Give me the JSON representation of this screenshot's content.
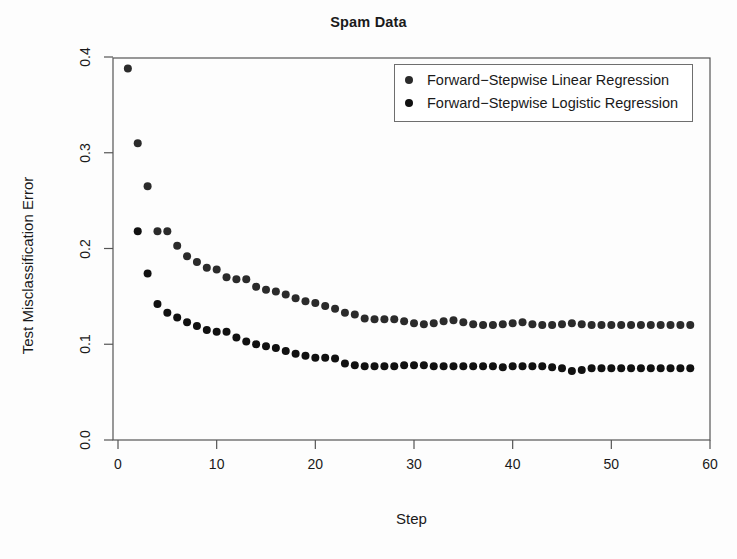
{
  "chart_data": {
    "type": "scatter",
    "title": "Spam Data",
    "xlabel": "Step",
    "ylabel": "Test Misclassification Error",
    "xlim": [
      0,
      60
    ],
    "ylim": [
      0.0,
      0.4
    ],
    "xticks": [
      0,
      10,
      20,
      30,
      40,
      50,
      60
    ],
    "xtick_labels": [
      "0",
      "10",
      "20",
      "30",
      "40",
      "50",
      "60"
    ],
    "yticks": [
      0.0,
      0.1,
      0.2,
      0.3,
      0.4
    ],
    "ytick_labels": [
      "0.0",
      "0.1",
      "0.2",
      "0.3",
      "0.4"
    ],
    "grid": false,
    "legend_position": "top-right",
    "marker": "filled-circle",
    "marker_size_px": 8,
    "series": [
      {
        "name": "Forward−Stepwise Linear Regression",
        "color": "#2b2b2b",
        "x": [
          1,
          2,
          3,
          4,
          5,
          6,
          7,
          8,
          9,
          10,
          11,
          12,
          13,
          14,
          15,
          16,
          17,
          18,
          19,
          20,
          21,
          22,
          23,
          24,
          25,
          26,
          27,
          28,
          29,
          30,
          31,
          32,
          33,
          34,
          35,
          36,
          37,
          38,
          39,
          40,
          41,
          42,
          43,
          44,
          45,
          46,
          47,
          48,
          49,
          50,
          51,
          52,
          53,
          54,
          55,
          56,
          57,
          58
        ],
        "y": [
          0.388,
          0.31,
          0.265,
          0.218,
          0.218,
          0.203,
          0.192,
          0.186,
          0.18,
          0.178,
          0.17,
          0.168,
          0.168,
          0.16,
          0.157,
          0.155,
          0.152,
          0.148,
          0.145,
          0.143,
          0.14,
          0.137,
          0.133,
          0.131,
          0.127,
          0.126,
          0.126,
          0.126,
          0.124,
          0.122,
          0.121,
          0.122,
          0.124,
          0.125,
          0.123,
          0.121,
          0.12,
          0.12,
          0.121,
          0.122,
          0.123,
          0.121,
          0.12,
          0.12,
          0.121,
          0.122,
          0.121,
          0.12,
          0.12,
          0.12,
          0.12,
          0.12,
          0.12,
          0.12,
          0.12,
          0.12,
          0.12,
          0.12
        ]
      },
      {
        "name": "Forward−Stepwise Logistic Regression",
        "color": "#111111",
        "x": [
          2,
          3,
          4,
          5,
          6,
          7,
          8,
          9,
          10,
          11,
          12,
          13,
          14,
          15,
          16,
          17,
          18,
          19,
          20,
          21,
          22,
          23,
          24,
          25,
          26,
          27,
          28,
          29,
          30,
          31,
          32,
          33,
          34,
          35,
          36,
          37,
          38,
          39,
          40,
          41,
          42,
          43,
          44,
          45,
          46,
          47,
          48,
          49,
          50,
          51,
          52,
          53,
          54,
          55,
          56,
          57,
          58
        ],
        "y": [
          0.218,
          0.174,
          0.142,
          0.133,
          0.128,
          0.123,
          0.119,
          0.115,
          0.113,
          0.113,
          0.107,
          0.103,
          0.1,
          0.098,
          0.096,
          0.093,
          0.09,
          0.088,
          0.086,
          0.086,
          0.085,
          0.08,
          0.078,
          0.077,
          0.077,
          0.077,
          0.077,
          0.078,
          0.078,
          0.078,
          0.077,
          0.077,
          0.077,
          0.077,
          0.077,
          0.077,
          0.077,
          0.076,
          0.077,
          0.077,
          0.077,
          0.077,
          0.076,
          0.075,
          0.072,
          0.073,
          0.075,
          0.075,
          0.075,
          0.075,
          0.075,
          0.075,
          0.075,
          0.075,
          0.075,
          0.075,
          0.075
        ]
      }
    ],
    "axis_color": "#555555",
    "background_color": "#fdfdfd"
  }
}
